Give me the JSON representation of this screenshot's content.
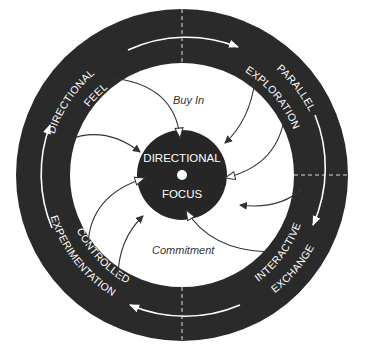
{
  "diagram": {
    "center": {
      "line1": "DIRECTIONAL",
      "line2": "FOCUS"
    },
    "stages": [
      {
        "id": "directional-feel",
        "line1": "DIRECTIONAL",
        "line2": "FEEL"
      },
      {
        "id": "parallel-exploration",
        "line1": "PARALLEL",
        "line2": "EXPLORATION"
      },
      {
        "id": "interactive-exchange",
        "line1": "INTERACTIVE",
        "line2": "EXCHANGE"
      },
      {
        "id": "controlled-experimentation",
        "line1": "CONTROLLED",
        "line2": "EXPERIMENTATION"
      }
    ],
    "flow_labels": {
      "buy_in": "Buy In",
      "commitment": "Commitment"
    },
    "colors": {
      "ring": "#2a2a2a",
      "hub": "#262626",
      "track": "#ffffff",
      "arrow": "#333333",
      "background": "#ffffff"
    }
  }
}
